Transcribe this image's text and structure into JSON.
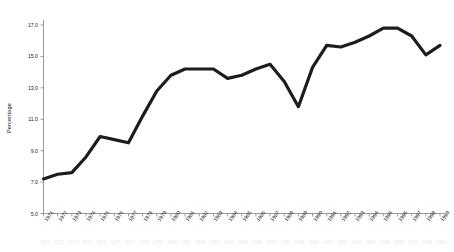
{
  "chart_data": {
    "type": "line",
    "title": "",
    "xlabel": "",
    "ylabel": "Percentage",
    "xlim": [
      1971,
      1999
    ],
    "ylim": [
      5.0,
      17.0
    ],
    "grid": false,
    "legend": null,
    "ytick_labels": [
      "17.0",
      "15.0",
      "13.0",
      "11.0",
      "9.0",
      "7.0",
      "5.0"
    ],
    "ytick_values": [
      17.0,
      15.0,
      13.0,
      11.0,
      9.0,
      7.0,
      5.0
    ],
    "categories": [
      "1971",
      "1972",
      "1973",
      "1974",
      "1975",
      "1976",
      "1977",
      "1978",
      "1979",
      "1980",
      "1981",
      "1982",
      "1983",
      "1984",
      "1985",
      "1986",
      "1987",
      "1988",
      "1989",
      "1990",
      "1991",
      "1992",
      "1993",
      "1994",
      "1995",
      "1996",
      "1997",
      "1998",
      "1999"
    ],
    "values": [
      7.2,
      7.5,
      7.6,
      8.6,
      9.9,
      9.7,
      9.5,
      11.2,
      12.8,
      13.8,
      14.2,
      14.2,
      14.2,
      13.6,
      13.8,
      14.2,
      14.5,
      13.4,
      11.8,
      14.3,
      15.7,
      15.6,
      15.9,
      16.3,
      16.8,
      16.8,
      16.3,
      15.1,
      15.7
    ],
    "series_name": "Percentage",
    "line_color": "#1d1d1d",
    "line_width": 3.2,
    "axis_color": "#9a9a9a"
  }
}
